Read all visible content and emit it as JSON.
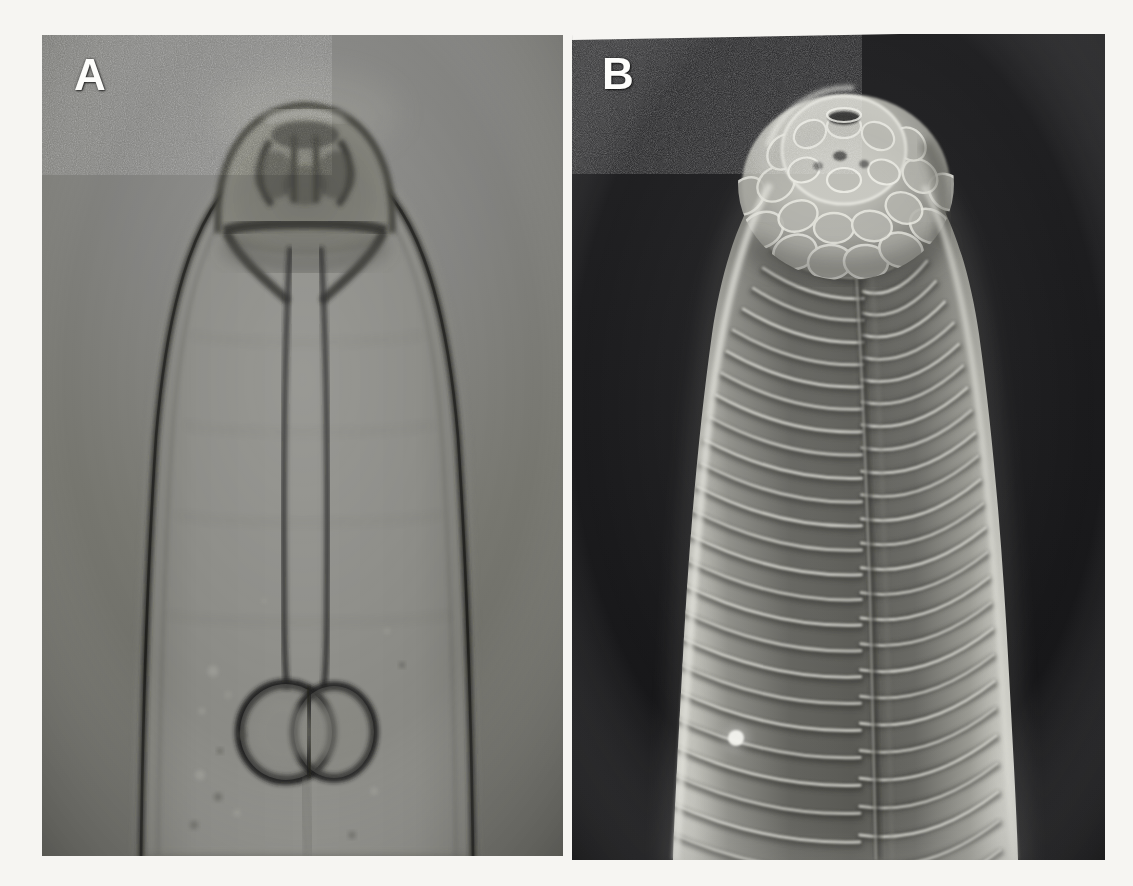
{
  "figure": {
    "kind": "two-panel-micrograph",
    "background_color": "#f6f5f2",
    "panels": [
      {
        "id": "A",
        "label": "A",
        "modality": "light-micrograph",
        "label_color": "#fdfdfb",
        "background_color": "#7a7a74",
        "description": "Light micrograph of the anterior end showing cephalic cap, stoma, slender esophageal tube and paired esophageal bulbs",
        "features": [
          "cephalic-cap",
          "lip-region",
          "stoma",
          "esophageal-tube",
          "paired-esophageal-bulbs",
          "cuticle-body-wall",
          "intestinal-lumen",
          "granules"
        ]
      },
      {
        "id": "B",
        "label": "B",
        "modality": "scanning-electron-micrograph",
        "label_color": "#fdfdfb",
        "background_color": "#1b1b1d",
        "description": "Scanning electron micrograph of the anterior end showing the lobed lip region with oral opening and regular transverse cuticular annulations interrupted by a lateral line",
        "features": [
          "lip-region-lobes",
          "oral-opening",
          "amphid-pore",
          "cephalic-papillae",
          "cuticular-annulations",
          "lateral-line-seam",
          "rim-highlight",
          "surface-debris-particle"
        ]
      }
    ]
  },
  "panel_a": {
    "label": "A",
    "label_x": 32,
    "label_y": 18,
    "tones": {
      "background": "#7a7a74",
      "body_interior": "#848480",
      "cuticle_line": "#2e2e2c",
      "dark_structure": "#3a3a36",
      "highlight": "#9c9c97"
    }
  },
  "panel_b": {
    "label": "B",
    "label_x": 30,
    "label_y": 18,
    "tones": {
      "background": "#1b1b1d",
      "body_mid": "#5d5d5a",
      "annulation_ridge": "#cfcfc8",
      "rim_highlight": "#e8e8e2",
      "shadow": "#2a2a28"
    }
  }
}
